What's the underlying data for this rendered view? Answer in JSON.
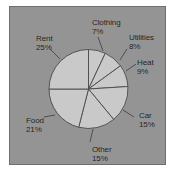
{
  "chart_data": {
    "type": "pie",
    "title": "",
    "subtitle": "",
    "xlabel": "",
    "ylabel": "",
    "legend_position": "none",
    "grid": false,
    "labels_show_percent": true,
    "start_angle_deg": 0,
    "direction": "clockwise",
    "categories": [
      "Clothing",
      "Utilities",
      "Heat",
      "Car",
      "Other",
      "Food",
      "Rent"
    ],
    "values": [
      7,
      8,
      9,
      15,
      15,
      21,
      25
    ],
    "unit": "%",
    "total": 100,
    "slices": [
      {
        "label": "Clothing",
        "value": 7,
        "value_text": "7%",
        "start_deg": 0,
        "end_deg": 25.2,
        "label_position": "top"
      },
      {
        "label": "Utilities",
        "value": 8,
        "value_text": "8%",
        "start_deg": 25.2,
        "end_deg": 54.0,
        "label_position": "top-right"
      },
      {
        "label": "Heat",
        "value": 9,
        "value_text": "9%",
        "start_deg": 54.0,
        "end_deg": 86.4,
        "label_position": "right-upper"
      },
      {
        "label": "Car",
        "value": 15,
        "value_text": "15%",
        "start_deg": 86.4,
        "end_deg": 140.4,
        "label_position": "right-lower"
      },
      {
        "label": "Other",
        "value": 15,
        "value_text": "15%",
        "start_deg": 140.4,
        "end_deg": 194.4,
        "label_position": "bottom"
      },
      {
        "label": "Food",
        "value": 21,
        "value_text": "21%",
        "start_deg": 194.4,
        "end_deg": 270.0,
        "label_position": "left-lower"
      },
      {
        "label": "Rent",
        "value": 25,
        "value_text": "25%",
        "start_deg": 270.0,
        "end_deg": 360.0,
        "label_position": "left-upper"
      }
    ],
    "colors": {
      "slice_fill": "#c9c9c9",
      "slice_stroke": "#4a4a4a",
      "plot_background": "#949494",
      "frame_border": "#6e6e6e",
      "label_text": "#1b1b1b",
      "figure_background": "#ffffff"
    }
  }
}
